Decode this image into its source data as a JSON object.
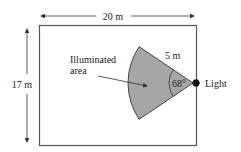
{
  "diagram": {
    "width_label": "20 m",
    "height_label": "17 m",
    "radius_label": "5 m",
    "angle_label": "68°",
    "area_label_line1": "Illuminated",
    "area_label_line2": "area",
    "light_label": "Light",
    "colors": {
      "sector_fill": "#a6a6a6",
      "stroke": "#333333",
      "background": "#ffffff"
    }
  }
}
